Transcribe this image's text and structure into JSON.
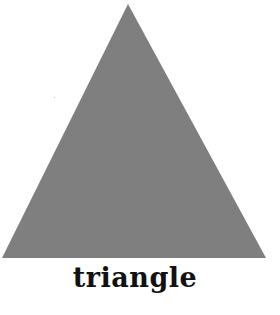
{
  "shape": {
    "name": "triangle",
    "fill": "#7f7f7f",
    "vertices": [
      [
        128,
        4
      ],
      [
        2,
        258
      ],
      [
        266,
        258
      ]
    ]
  },
  "label": "triangle"
}
